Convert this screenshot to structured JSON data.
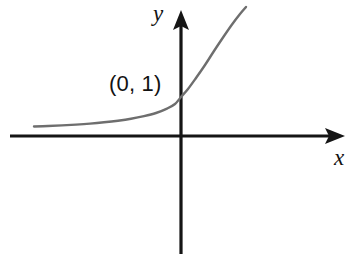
{
  "figure": {
    "name": "exponential-function-graph",
    "background_color": "#ffffff",
    "width": 348,
    "height": 254
  },
  "labels": {
    "y_axis": "y",
    "x_axis": "x",
    "intercept": "(0, 1)"
  },
  "colors": {
    "axis": "#151515",
    "curve": "#6e6e6e",
    "text": "#121212"
  },
  "chart_data": {
    "type": "line",
    "title": "",
    "subtitle": "",
    "xlabel": "x",
    "ylabel": "y",
    "grid": false,
    "legend": null,
    "annotations": [
      {
        "text": "(0, 1)",
        "x": 0,
        "y": 1,
        "description": "y-intercept of the exponential curve"
      }
    ],
    "axes": {
      "origin_px": [
        181,
        136
      ],
      "x_axis_px": {
        "start": [
          10,
          136
        ],
        "end": [
          345,
          136
        ],
        "arrow": "right"
      },
      "y_axis_px": {
        "start": [
          181,
          254
        ],
        "end": [
          181,
          10
        ],
        "arrow": "up"
      },
      "xlim": [
        -3.1,
        2.4
      ],
      "ylim": [
        -3.1,
        2.6
      ]
    },
    "series": [
      {
        "name": "exponential curve",
        "color": "#6e6e6e",
        "description": "Increasing exponential curve y = b^x with b > 1, approaching the x-axis asymptotically on the left and rising steeply on the right, passing through (0, 1).",
        "points_px": [
          [
            34,
            126.5
          ],
          [
            48,
            126.0
          ],
          [
            62,
            125.4
          ],
          [
            76,
            124.6
          ],
          [
            90,
            123.6
          ],
          [
            104,
            122.3
          ],
          [
            118,
            120.7
          ],
          [
            131,
            118.8
          ],
          [
            144,
            116.2
          ],
          [
            156,
            113.0
          ],
          [
            167,
            108.6
          ],
          [
            175,
            104.0
          ],
          [
            181,
            97.0
          ],
          [
            188,
            89.0
          ],
          [
            196,
            78.0
          ],
          [
            205,
            65.0
          ],
          [
            214,
            51.0
          ],
          [
            223,
            37.5
          ],
          [
            232,
            24.5
          ],
          [
            240,
            14.0
          ],
          [
            246,
            7.0
          ]
        ]
      }
    ]
  }
}
